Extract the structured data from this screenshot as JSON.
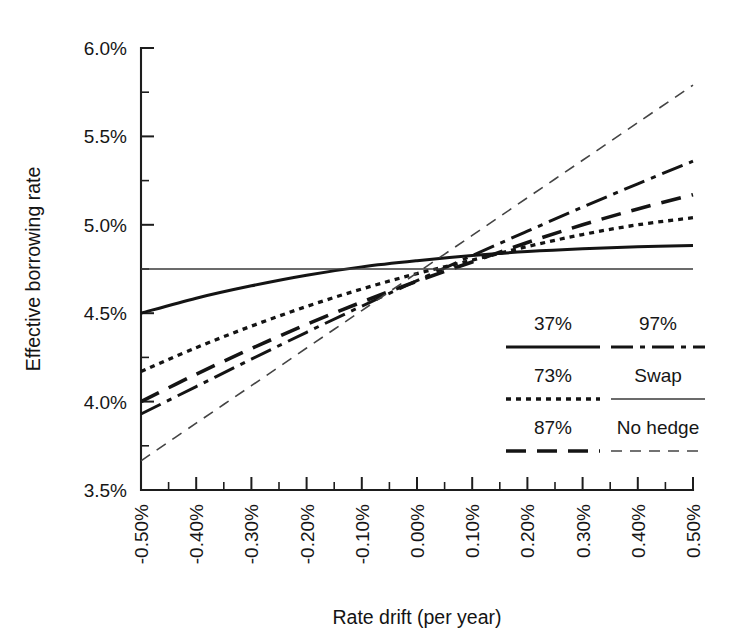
{
  "chart_data": {
    "type": "line",
    "title": "",
    "xlabel": "Rate drift (per year)",
    "ylabel": "Effective borrowing rate",
    "xlim": [
      -0.5,
      0.5
    ],
    "ylim": [
      3.5,
      6.0
    ],
    "grid": false,
    "legend_position": "inside-lower-right",
    "x_tick_labels": [
      "-0.50%",
      "-0.40%",
      "-0.30%",
      "-0.20%",
      "-0.10%",
      "0.00%",
      "0.10%",
      "0.20%",
      "0.30%",
      "0.40%",
      "0.50%"
    ],
    "x_tick_values": [
      -0.5,
      -0.4,
      -0.3,
      -0.2,
      -0.1,
      0.0,
      0.1,
      0.2,
      0.3,
      0.4,
      0.5
    ],
    "y_tick_labels": [
      "3.5%",
      "4.0%",
      "4.5%",
      "5.0%",
      "5.5%",
      "6.0%"
    ],
    "y_tick_values": [
      3.5,
      4.0,
      4.5,
      5.0,
      5.5,
      6.0
    ],
    "x_minor_step": 0.05,
    "y_minor_step": 0.25,
    "x": [
      -0.5,
      -0.4,
      -0.3,
      -0.2,
      -0.1,
      0.0,
      0.1,
      0.2,
      0.3,
      0.4,
      0.5
    ],
    "series": [
      {
        "name": "37%",
        "style": "solid",
        "width": 3.0,
        "color": "#141414",
        "values": [
          4.5,
          4.585,
          4.655,
          4.715,
          4.762,
          4.797,
          4.826,
          4.849,
          4.865,
          4.876,
          4.883
        ]
      },
      {
        "name": "73%",
        "style": "dotted",
        "width": 3.3,
        "color": "#141414",
        "values": [
          4.17,
          4.305,
          4.427,
          4.538,
          4.637,
          4.724,
          4.8,
          4.877,
          4.945,
          5.0,
          5.04
        ]
      },
      {
        "name": "87%",
        "style": "longdash",
        "width": 3.6,
        "color": "#141414",
        "values": [
          4.0,
          4.155,
          4.3,
          4.437,
          4.563,
          4.681,
          4.79,
          4.9,
          5.0,
          5.09,
          5.17
        ]
      },
      {
        "name": "97%",
        "style": "dashdot",
        "width": 3.0,
        "color": "#141414",
        "values": [
          3.93,
          4.085,
          4.24,
          4.392,
          4.54,
          4.684,
          4.826,
          4.964,
          5.1,
          5.232,
          5.36
        ]
      },
      {
        "name": "Swap",
        "style": "thin-solid",
        "width": 1.4,
        "color": "#3a3a3a",
        "values": [
          4.75,
          4.75,
          4.75,
          4.75,
          4.75,
          4.75,
          4.75,
          4.75,
          4.75,
          4.75,
          4.75
        ]
      },
      {
        "name": "No hedge",
        "style": "thin-dash",
        "width": 1.6,
        "color": "#444444",
        "values": [
          3.665,
          3.878,
          4.09,
          4.303,
          4.515,
          4.728,
          4.94,
          5.153,
          5.365,
          5.578,
          5.79
        ]
      }
    ]
  },
  "legend": {
    "columns": [
      {
        "items": [
          {
            "label": "37%",
            "style": "solid"
          },
          {
            "label": "73%",
            "style": "dotted"
          },
          {
            "label": "87%",
            "style": "longdash"
          }
        ]
      },
      {
        "items": [
          {
            "label": "97%",
            "style": "dashdot"
          },
          {
            "label": "Swap",
            "style": "thin-solid"
          },
          {
            "label": "No hedge",
            "style": "thin-dash"
          }
        ]
      }
    ]
  }
}
